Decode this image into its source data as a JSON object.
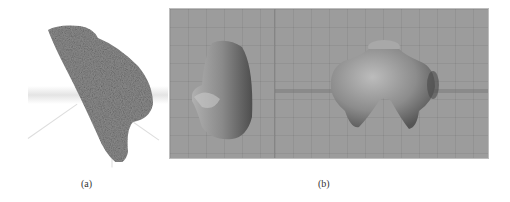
{
  "figure": {
    "panels": [
      {
        "id": "a",
        "caption": "(a)",
        "description": "Photograph of a stone fragment on a white background with faint 3D axis lines"
      },
      {
        "id": "b",
        "caption": "(b)",
        "description": "3D modeling software viewports showing reconstructed figurine torso mesh",
        "viewports": [
          {
            "name": "side-view",
            "label": ""
          },
          {
            "name": "front-view",
            "label": ""
          }
        ],
        "colors": {
          "viewport_bg": "#9c9c9c",
          "mesh": "#8a8a8a"
        }
      }
    ]
  }
}
